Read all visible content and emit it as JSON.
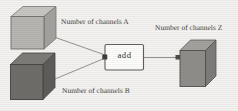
{
  "figure": {
    "type": "block-diagram",
    "background_color": "#f4f3f1",
    "operation_label": "add",
    "labels": {
      "input_a": "Number of channels A",
      "input_b": "Number of channels B",
      "output_z": "Number of channels Z"
    },
    "nodes": [
      {
        "id": "cube-a",
        "role": "input-tensor-a",
        "shape": "cube",
        "fill_color": "#b3b1ad",
        "top_face_color": "#c8c6c2",
        "side_face_color": "#9d9b97",
        "edge_color": "#6e6c68"
      },
      {
        "id": "cube-b",
        "role": "input-tensor-b",
        "shape": "cube",
        "fill_color": "#6d6b68",
        "top_face_color": "#7e7c79",
        "side_face_color": "#5b5956",
        "edge_color": "#3e3c3a"
      },
      {
        "id": "op-add",
        "role": "operation-block",
        "shape": "rounded-rectangle",
        "fill_color": "#fdfdfc",
        "edge_color": "#5d5b58"
      },
      {
        "id": "cube-z",
        "role": "output-tensor-z",
        "shape": "cube",
        "fill_color": "#8e8c89",
        "top_face_color": "#a09e9a",
        "side_face_color": "#7a7875",
        "edge_color": "#4d4b48"
      }
    ],
    "connectors": [
      {
        "id": "edge-a-to-add",
        "from": "cube-a",
        "to": "op-add",
        "style": "line",
        "color": "#7b7975"
      },
      {
        "id": "edge-b-to-add",
        "from": "cube-b",
        "to": "op-add",
        "style": "line",
        "color": "#7b7975"
      },
      {
        "id": "edge-add-to-z",
        "from": "op-add",
        "to": "cube-z",
        "style": "arrow",
        "color": "#7b7975"
      }
    ]
  }
}
